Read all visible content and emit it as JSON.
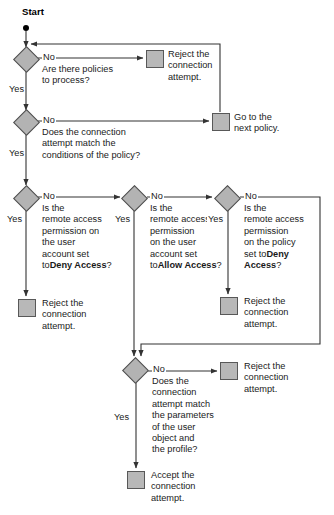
{
  "diagram": {
    "start_label": "Start",
    "colors": {
      "shape_fill": "#b3b3b3",
      "shape_stroke": "#4d4d4d",
      "line": "#333333",
      "text": "#1a1a1a",
      "background": "#ffffff"
    },
    "decisions": [
      {
        "id": "d1",
        "text": "Are there policies\nto process?",
        "yes_label": "Yes",
        "no_label": "No"
      },
      {
        "id": "d2",
        "text": "Does the connection\nattempt match the\nconditions of the policy?",
        "yes_label": "Yes",
        "no_label": "No"
      },
      {
        "id": "d3",
        "text_plain": "Is the\nremote access\npermission on\nthe user\naccount set to",
        "text_bold": "Deny Access",
        "text_tail": "?",
        "yes_label": "Yes",
        "no_label": "No"
      },
      {
        "id": "d4",
        "text_plain": "Is the\nremote access\npermission\non the user\naccount set to",
        "text_bold": "Allow Access",
        "text_tail": "?",
        "yes_label": "Yes",
        "no_label": "No"
      },
      {
        "id": "d5",
        "text_plain": "Is the\nremote access\npermission\non the policy\nset to",
        "text_bold": "Deny Access",
        "text_tail": "?",
        "yes_label": "Yes",
        "no_label": "No"
      },
      {
        "id": "d6",
        "text": "Does the\nconnection\nattempt match\nthe parameters\nof the user\nobject and\nthe profile?",
        "yes_label": "Yes",
        "no_label": "No"
      }
    ],
    "terminals": [
      {
        "id": "t1",
        "text": "Reject the\nconnection\nattempt."
      },
      {
        "id": "t2",
        "text": "Go to the\nnext policy."
      },
      {
        "id": "t3",
        "text": "Reject the\nconnection\nattempt."
      },
      {
        "id": "t4",
        "text": "Reject the\nconnection\nattempt."
      },
      {
        "id": "t5",
        "text": "Reject the\nconnection\nattempt."
      },
      {
        "id": "t6",
        "text": "Accept the\nconnection\nattempt."
      }
    ]
  }
}
